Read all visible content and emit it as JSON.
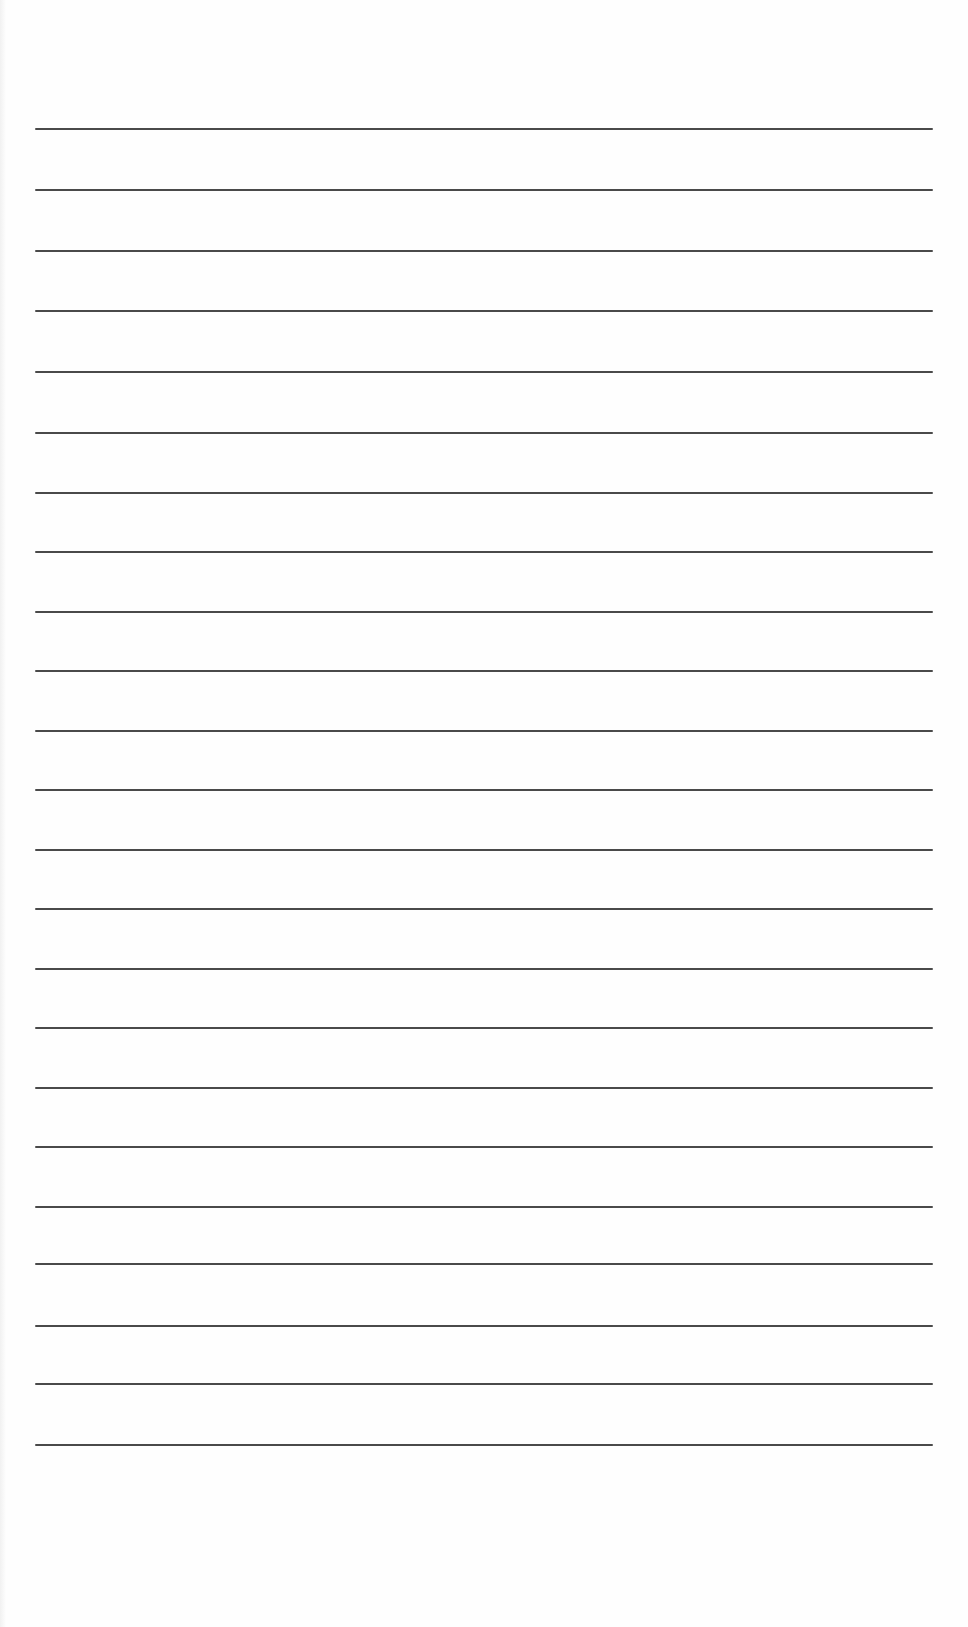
{
  "page": {
    "type": "blank-lined-paper",
    "background_color": "#fefefe",
    "line_color": "#4a4a4a",
    "line_count": 23,
    "line_left": 35,
    "line_right": 933,
    "lines_y": [
      128,
      189,
      250,
      310,
      371,
      432,
      492,
      551,
      611,
      670,
      730,
      789,
      849,
      908,
      968,
      1027,
      1087,
      1146,
      1206,
      1263,
      1325,
      1383,
      1444
    ]
  }
}
